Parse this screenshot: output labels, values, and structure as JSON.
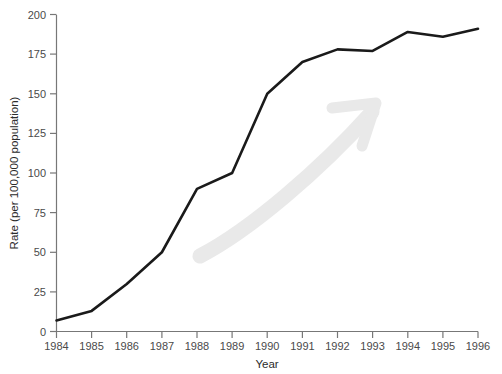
{
  "chart_data": {
    "type": "line",
    "title": "",
    "xlabel": "Year",
    "ylabel": "Rate (per 100,000 population)",
    "x": [
      1984,
      1985,
      1986,
      1987,
      1988,
      1989,
      1990,
      1991,
      1992,
      1993,
      1994,
      1995,
      1996
    ],
    "values": [
      7,
      13,
      30,
      50,
      90,
      100,
      150,
      170,
      178,
      177,
      189,
      186,
      191
    ],
    "xtick_labels": [
      "1984",
      "1985",
      "1986",
      "1987",
      "1988",
      "1989",
      "1990",
      "1991",
      "1992",
      "1993",
      "1994",
      "1995",
      "1996"
    ],
    "ytick_labels": [
      "0",
      "25",
      "50",
      "75",
      "100",
      "125",
      "150",
      "175",
      "200"
    ],
    "yticks": [
      0,
      25,
      50,
      75,
      100,
      125,
      150,
      175,
      200
    ],
    "xlim": [
      1984,
      1996
    ],
    "ylim": [
      0,
      200
    ],
    "grid": false,
    "legend": null,
    "series": [
      {
        "name": "Rate",
        "color": "#1a1a1a",
        "values": [
          7,
          13,
          30,
          50,
          90,
          100,
          150,
          170,
          178,
          177,
          189,
          186,
          191
        ]
      }
    ],
    "annotations": [
      {
        "name": "upward-trend-arrow-watermark",
        "color": "#e8e8e8",
        "direction": "up-right"
      }
    ],
    "colors": {
      "line": "#1a1a1a",
      "axis": "#777777",
      "tick_text": "#4a4a4a",
      "watermark": "#e8e8e8",
      "background": "#ffffff"
    }
  }
}
